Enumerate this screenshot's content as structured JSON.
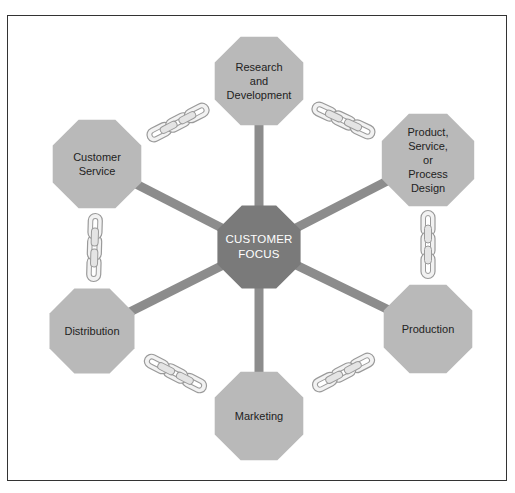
{
  "diagram": {
    "center": {
      "label": "CUSTOMER\nFOCUS",
      "cx": 259,
      "cy": 247,
      "r": 45
    },
    "nodes": [
      {
        "id": "research",
        "label": "Research\nand\nDevelopment",
        "cx": 259,
        "cy": 81,
        "r": 48
      },
      {
        "id": "product-design",
        "label": "Product,\nService,\nor\nProcess\nDesign",
        "cx": 428,
        "cy": 160,
        "r": 50
      },
      {
        "id": "production",
        "label": "Production",
        "cx": 428,
        "cy": 329,
        "r": 48
      },
      {
        "id": "marketing",
        "label": "Marketing",
        "cx": 259,
        "cy": 416,
        "r": 48
      },
      {
        "id": "distribution",
        "label": "Distribution",
        "cx": 92,
        "cy": 331,
        "r": 46
      },
      {
        "id": "customer-service",
        "label": "Customer\nService",
        "cx": 97,
        "cy": 164,
        "r": 48
      }
    ],
    "colors": {
      "node_fill": "#b9b9b9",
      "center_fill": "#7a7a7a",
      "spoke": "#8c8c8c",
      "chain_fill": "#f2f2f2",
      "chain_stroke": "#9a9a9a",
      "frame": "#333333"
    }
  }
}
